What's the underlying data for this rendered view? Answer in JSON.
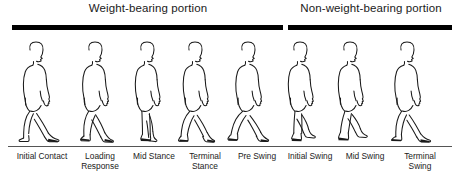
{
  "diagram": {
    "ground_color": "#555555",
    "bar_color": "#000000",
    "figure_stroke": "#1a1a1a"
  },
  "portions": [
    {
      "id": "weight-bearing",
      "label": "Weight-bearing portion"
    },
    {
      "id": "non-weight-bearing",
      "label": "Non-weight-bearing portion"
    }
  ],
  "phases": [
    {
      "index": 1,
      "label": "Initial Contact",
      "portion": "weight-bearing"
    },
    {
      "index": 2,
      "label": "Loading\nResponse",
      "portion": "weight-bearing"
    },
    {
      "index": 3,
      "label": "Mid Stance",
      "portion": "weight-bearing"
    },
    {
      "index": 4,
      "label": "Terminal\nStance",
      "portion": "weight-bearing"
    },
    {
      "index": 5,
      "label": "Pre Swing",
      "portion": "weight-bearing"
    },
    {
      "index": 6,
      "label": "Initial Swing",
      "portion": "non-weight-bearing"
    },
    {
      "index": 7,
      "label": "Mid Swing",
      "portion": "non-weight-bearing"
    },
    {
      "index": 8,
      "label": "Terminal\nSwing",
      "portion": "non-weight-bearing"
    }
  ]
}
